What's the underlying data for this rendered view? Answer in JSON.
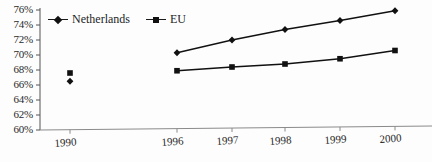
{
  "chart_data": {
    "type": "line",
    "title": "",
    "subtitle": "",
    "xlabel": "",
    "ylabel": "",
    "x": [
      "1990",
      "1996",
      "1997",
      "1998",
      "1999",
      "2000"
    ],
    "categories": [
      "1990",
      "1996",
      "1997",
      "1998",
      "1999",
      "2000"
    ],
    "xtick_labels": [
      "1990",
      "1996",
      "1997",
      "1998",
      "1999",
      "2000"
    ],
    "ytick_labels": [
      "76%",
      "74%",
      "72%",
      "70%",
      "68%",
      "66%",
      "64%",
      "62%",
      "60%"
    ],
    "ytick_values": [
      76,
      74,
      72,
      70,
      68,
      66,
      64,
      62,
      60
    ],
    "ylim": [
      60,
      76
    ],
    "grid": false,
    "legend_position": "top-left-inside",
    "gap_after_first_point": true,
    "series": [
      {
        "name": "Netherlands",
        "marker": "diamond",
        "color": "#111111",
        "values": [
          66.5,
          70.3,
          72.0,
          73.4,
          74.6,
          75.9
        ]
      },
      {
        "name": "EU",
        "marker": "square",
        "color": "#111111",
        "values": [
          67.6,
          67.9,
          68.4,
          68.8,
          69.5,
          70.6
        ]
      }
    ]
  },
  "legend": {
    "items": [
      {
        "label": "Netherlands",
        "marker": "diamond"
      },
      {
        "label": "EU",
        "marker": "square"
      }
    ]
  },
  "axis": {
    "y_axis_name": "percentage-axis",
    "x_axis_name": "year-axis"
  }
}
